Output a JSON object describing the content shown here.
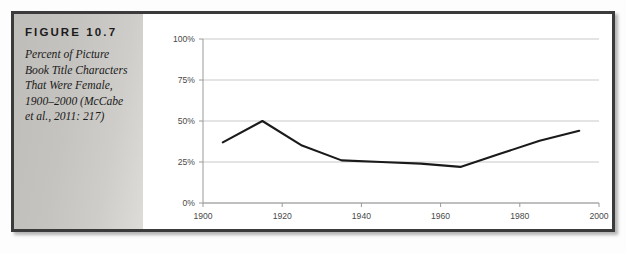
{
  "figure": {
    "label": "FIGURE 10.7",
    "caption": "Percent of Picture Book Title Characters That Were Female, 1900–2000 (McCabe et al., 2011: 217)"
  },
  "colors": {
    "frame_border": "#3b3b3b",
    "caption_panel": "#c8c6c2",
    "plot_line": "#1a1a1a",
    "gridline": "#c9c9c9",
    "axis": "#9a9a9a",
    "tick_text": "#4a4a4a",
    "plot_background": "#ffffff"
  },
  "chart_data": {
    "type": "line",
    "title": "",
    "xlabel": "",
    "ylabel": "",
    "xlim": [
      1900,
      2000
    ],
    "ylim": [
      0,
      100
    ],
    "grid": true,
    "legend": "none",
    "x_ticks": [
      "1900",
      "1920",
      "1940",
      "1960",
      "1980",
      "2000"
    ],
    "x_tick_values": [
      1900,
      1920,
      1940,
      1960,
      1980,
      2000
    ],
    "y_ticks": [
      "0%",
      "25%",
      "50%",
      "75%",
      "100%"
    ],
    "y_tick_values": [
      0,
      25,
      50,
      75,
      100
    ],
    "series": [
      {
        "name": "Percent female title characters",
        "x": [
          1905,
          1915,
          1925,
          1935,
          1945,
          1955,
          1965,
          1975,
          1985,
          1995
        ],
        "values": [
          37,
          50,
          35,
          26,
          25,
          24,
          22,
          30,
          38,
          44
        ]
      }
    ]
  }
}
